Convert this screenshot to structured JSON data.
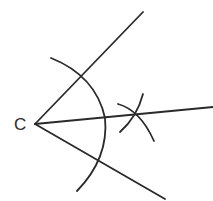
{
  "diagram": {
    "type": "angle-bisector-construction",
    "vertex_label": "C",
    "stroke_color": "#2a2a2a",
    "background": "#ffffff"
  }
}
